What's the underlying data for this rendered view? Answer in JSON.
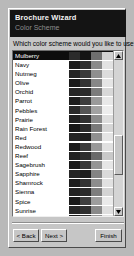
{
  "window": {
    "title": "Brochure Wizard",
    "subtitle": "Color Scheme"
  },
  "main": {
    "question": "Which color scheme would you like to use?"
  },
  "colors": {
    "banner_bg": "#141414",
    "banner_title_fg": "#ffffff",
    "banner_subtitle_fg": "#8e8e8e",
    "dialog_bg": "#c6c6c6",
    "list_bg": "#ffffff",
    "selection_bg": "#0d0d0d",
    "selection_fg": "#ffffff",
    "desktop_bg": "#b9b9b9"
  },
  "list": {
    "name": "color-scheme-list",
    "selected_index": 0,
    "selected_value": "Mulberry",
    "items": [
      {
        "label": "Mulberry",
        "swatches": [
          "#2b2b2b",
          "#141414",
          "#6f6f6f",
          "#d2d2d2"
        ]
      },
      {
        "label": "Navy",
        "swatches": [
          "#1c1c1c",
          "#2f2f2f",
          "#8a8a8a",
          "#e2e2e2"
        ]
      },
      {
        "label": "Nutmeg",
        "swatches": [
          "#232323",
          "#3a3a3a",
          "#8f8f8f",
          "#dcdcdc"
        ]
      },
      {
        "label": "Olive",
        "swatches": [
          "#1a1a1a",
          "#343434",
          "#878787",
          "#e5e5e5"
        ]
      },
      {
        "label": "Orchid",
        "swatches": [
          "#262626",
          "#2c2c2c",
          "#7c7c7c",
          "#d8d8d8"
        ]
      },
      {
        "label": "Parrot",
        "swatches": [
          "#1e1e1e",
          "#3e3e3e",
          "#9a9a9a",
          "#e8e8e8"
        ]
      },
      {
        "label": "Pebbles",
        "swatches": [
          "#2a2a2a",
          "#555555",
          "#a2a2a2",
          "#ededed"
        ]
      },
      {
        "label": "Prairie",
        "swatches": [
          "#202020",
          "#313131",
          "#8c8c8c",
          "#dedede"
        ]
      },
      {
        "label": "Rain Forest",
        "swatches": [
          "#171717",
          "#2a2a2a",
          "#7a7a7a",
          "#d6d6d6"
        ]
      },
      {
        "label": "Red",
        "swatches": [
          "#242424",
          "#1f1f1f",
          "#909090",
          "#e4e4e4"
        ]
      },
      {
        "label": "Redwood",
        "swatches": [
          "#1b1b1b",
          "#3c3c3c",
          "#999999",
          "#e0e0e0"
        ]
      },
      {
        "label": "Reef",
        "swatches": [
          "#212121",
          "#2e2e2e",
          "#6a6a6a",
          "#c9c9c9"
        ]
      },
      {
        "label": "Sagebrush",
        "swatches": [
          "#191919",
          "#383838",
          "#949494",
          "#e6e6e6"
        ]
      },
      {
        "label": "Sapphire",
        "swatches": [
          "#252525",
          "#1d1d1d",
          "#848484",
          "#dadada"
        ]
      },
      {
        "label": "Shamrock",
        "swatches": [
          "#1d1d1d",
          "#333333",
          "#8d8d8d",
          "#e1e1e1"
        ]
      },
      {
        "label": "Sienna",
        "swatches": [
          "#222222",
          "#2b2b2b",
          "#7e7e7e",
          "#d4d4d4"
        ]
      },
      {
        "label": "Spice",
        "swatches": [
          "#1a1a1a",
          "#3f3f3f",
          "#9d9d9d",
          "#eaeaea"
        ]
      },
      {
        "label": "Sunrise",
        "swatches": [
          "#272727",
          "#303030",
          "#898989",
          "#dfdfdf"
        ]
      },
      {
        "label": "Sunset",
        "swatches": [
          "#1e1e1e",
          "#363636",
          "#929292",
          "#e3e3e3"
        ]
      },
      {
        "label": "Teal",
        "swatches": [
          "#232323",
          "#282828",
          "#818181",
          "#d9d9d9"
        ]
      }
    ]
  },
  "scrollbar": {
    "up_arrow": "scroll-up",
    "down_arrow": "scroll-down",
    "thumb": "scroll-thumb"
  },
  "footer": {
    "back_label": "< Back",
    "next_label": "Next >",
    "finish_label": "Finish"
  }
}
